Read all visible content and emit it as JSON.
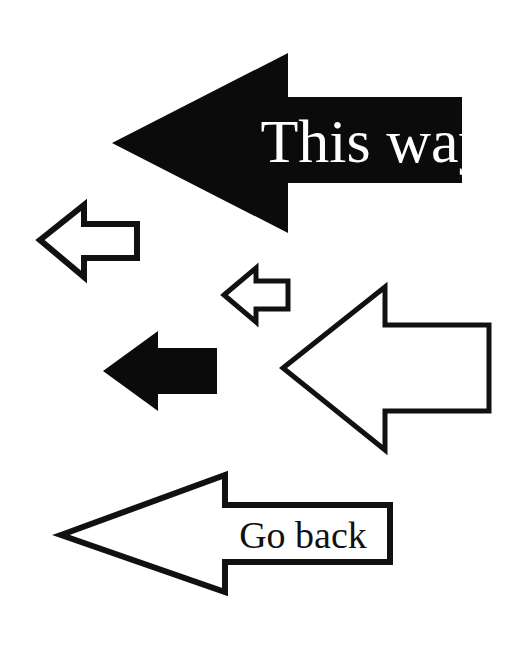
{
  "page": {
    "background_color": "#ffffff",
    "width": 509,
    "height": 646
  },
  "colors": {
    "ink": "#111111",
    "fill_black": "#0b0b0b",
    "paper": "#ffffff"
  },
  "arrows": [
    {
      "id": "this-way-arrow",
      "name": "large-black-left-arrow",
      "style": "filled",
      "direction": "left",
      "label": "This way",
      "label_color": "#ffffff",
      "label_font_size": 62,
      "label_x": 375,
      "label_y": 162,
      "points": "112,143 288,53 288,97 462,97 462,183 288,183 288,233",
      "stroke_width": 0
    },
    {
      "id": "small-outline-arrow",
      "name": "small-outlined-left-arrow",
      "style": "outline",
      "direction": "left",
      "label": "",
      "points": "40,240 84,205 84,224 137,224 137,258 84,258 84,277",
      "stroke_width": 6
    },
    {
      "id": "tiny-outline-arrow",
      "name": "tiny-outlined-left-arrow",
      "style": "outline",
      "direction": "left",
      "label": "",
      "points": "224,295 256,268 256,281 288,281 288,309 256,309 256,322",
      "stroke_width": 5
    },
    {
      "id": "medium-black-arrow",
      "name": "medium-black-left-arrow",
      "style": "filled",
      "direction": "left",
      "label": "",
      "points": "103,371 158,331 158,348 217,348 217,394 158,394 158,411",
      "stroke_width": 0
    },
    {
      "id": "large-outline-arrow",
      "name": "large-outlined-left-arrow",
      "style": "outline",
      "direction": "left",
      "label": "",
      "points": "283,368 385,287 385,325 489,325 489,411 385,411 385,450",
      "stroke_width": 5
    },
    {
      "id": "go-back-arrow",
      "name": "go-back-outlined-left-arrow",
      "style": "outline",
      "direction": "left",
      "label": "Go back",
      "label_color": "#111111",
      "label_font_size": 38,
      "label_x": 303,
      "label_y": 548,
      "points": "61,535 225,475 225,505 390,505 390,562 225,562 225,592",
      "stroke_width": 6
    }
  ]
}
